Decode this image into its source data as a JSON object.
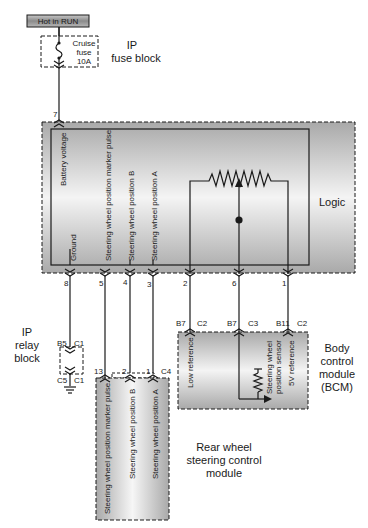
{
  "power_source": {
    "label": "Hot in RUN"
  },
  "fuse": {
    "line1": "Cruise",
    "line2": "fuse",
    "line3": "10A"
  },
  "ip_fuse_block": {
    "line1": "IP",
    "line2": "fuse block"
  },
  "logic_module": {
    "label": "Logic",
    "top_pin": "7",
    "inner_labels": {
      "battery_voltage": "Battery voltage",
      "ground": "Ground",
      "marker_pulse": "Steering wheel position marker pulse",
      "position_b": "Steering wheel position B",
      "position_a": "Steering wheel position A"
    },
    "bottom_pins": [
      "8",
      "5",
      "4",
      "3",
      "2",
      "6",
      "1"
    ]
  },
  "ip_relay_block": {
    "line1": "IP",
    "line2": "relay",
    "line3": "block",
    "top_pin": "B5",
    "top_connector": "C1",
    "bottom_pin": "C5",
    "bottom_connector": "C1"
  },
  "bcm": {
    "line1": "Body",
    "line2": "control",
    "line3": "module",
    "line4": "(BCM)",
    "pins": [
      {
        "pin": "B7",
        "connector": "C2",
        "label": "Low reference"
      },
      {
        "pin": "B7",
        "connector": "C3",
        "label": ""
      },
      {
        "pin": "B11",
        "connector": "C2",
        "label": "5V reference"
      }
    ],
    "sensor_line1": "Steering wheel",
    "sensor_line2": "position sensor"
  },
  "rear_module": {
    "line1": "Rear wheel",
    "line2": "steering control",
    "line3": "module",
    "connector": "C4",
    "pins": [
      "13",
      "2",
      "1"
    ],
    "labels": {
      "marker_pulse": "Steering wheel position marker pulse",
      "position_b": "Steering wheel position B",
      "position_a": "Steering wheel position A"
    }
  },
  "colors": {
    "wire": "#1a1a1a",
    "module_fill_light": "#f2f2f2",
    "module_fill_dark": "#a8a8a8",
    "hot_box_fill": "#9a9a9a"
  }
}
